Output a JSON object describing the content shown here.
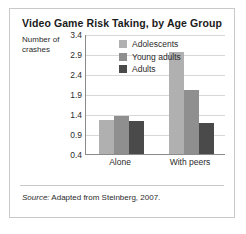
{
  "figure": {
    "title": "Video Game Risk Taking, by Age Group",
    "y_axis_title_line1": "Number of",
    "y_axis_title_line2": "crashes",
    "source_prefix": "Source:",
    "source_text": " Adapted from Steinberg, 2007.",
    "border_color": "#c9c9c9"
  },
  "chart_data": {
    "type": "bar",
    "title": "Video Game Risk Taking, by Age Group",
    "xlabel": "",
    "ylabel": "Number of crashes",
    "categories": [
      "Alone",
      "With peers"
    ],
    "series": [
      {
        "name": "Adolescents",
        "color": "#b0b0b0",
        "values": [
          1.25,
          2.95
        ]
      },
      {
        "name": "Young adults",
        "color": "#8f8f8f",
        "values": [
          1.35,
          2.0
        ]
      },
      {
        "name": "Adults",
        "color": "#4a4a4a",
        "values": [
          1.23,
          1.17
        ]
      }
    ],
    "ylim": [
      0.4,
      3.4
    ],
    "yticks": [
      "3.4",
      "2.9",
      "2.4",
      "1.9",
      "1.4",
      "0.9",
      "0.4"
    ],
    "ytick_values": [
      3.4,
      2.9,
      2.4,
      1.9,
      1.4,
      0.9,
      0.4
    ],
    "grid": true,
    "legend_position": "top-left-inside"
  }
}
